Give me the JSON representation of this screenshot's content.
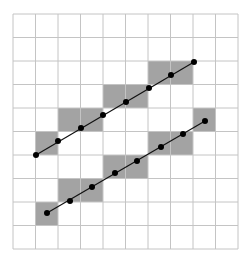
{
  "diagram": {
    "type": "pixel-line-rasterization",
    "colors": {
      "background": "#ffffff",
      "grid": "#c4c4c4",
      "shade": "#a3a3a3",
      "line": "#111111",
      "point": "#000000"
    },
    "grid": {
      "cols": 10,
      "rows": 10,
      "x0": 13,
      "y0": 14,
      "x1": 238,
      "y1": 249
    },
    "lines": [
      {
        "name": "upper-line",
        "shaded_cells": [
          {
            "col": 1,
            "row": 5
          },
          {
            "col": 2,
            "row": 4
          },
          {
            "col": 3,
            "row": 4
          },
          {
            "col": 4,
            "row": 3
          },
          {
            "col": 5,
            "row": 3
          },
          {
            "col": 6,
            "row": 2
          },
          {
            "col": 7,
            "row": 2
          }
        ],
        "points": [
          [
            36,
            155
          ],
          [
            58,
            141
          ],
          [
            81,
            128
          ],
          [
            103,
            115
          ],
          [
            126,
            102
          ],
          [
            149,
            88
          ],
          [
            171,
            75
          ],
          [
            194,
            62
          ]
        ]
      },
      {
        "name": "lower-line",
        "shaded_cells": [
          {
            "col": 1,
            "row": 8
          },
          {
            "col": 2,
            "row": 7
          },
          {
            "col": 3,
            "row": 7
          },
          {
            "col": 4,
            "row": 6
          },
          {
            "col": 5,
            "row": 6
          },
          {
            "col": 6,
            "row": 5
          },
          {
            "col": 7,
            "row": 5
          },
          {
            "col": 8,
            "row": 4
          }
        ],
        "points": [
          [
            47,
            213
          ],
          [
            70,
            201
          ],
          [
            92,
            187
          ],
          [
            115,
            173
          ],
          [
            137,
            161
          ],
          [
            161,
            147
          ],
          [
            183,
            134
          ],
          [
            205,
            121
          ]
        ]
      }
    ]
  }
}
